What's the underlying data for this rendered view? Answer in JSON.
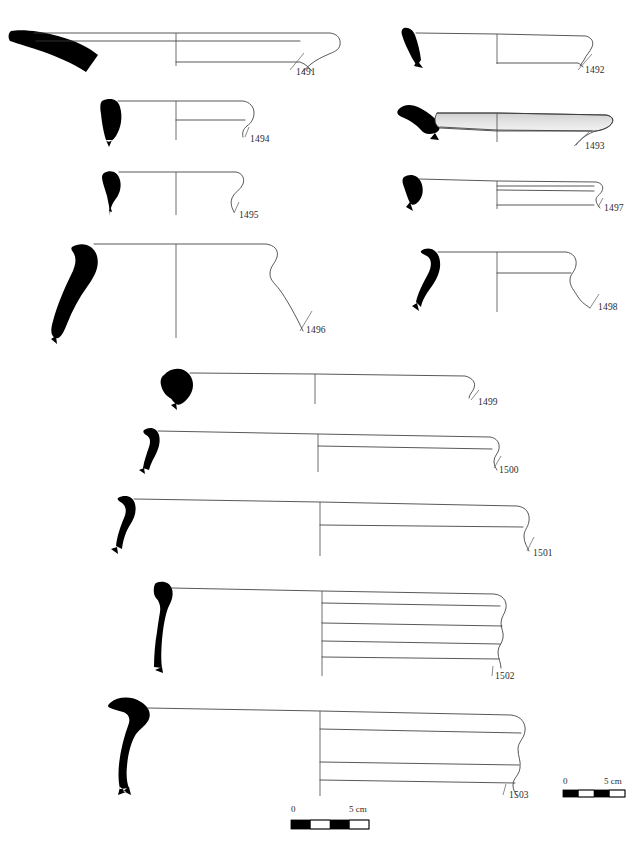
{
  "plate": {
    "title": "Pottery profile plate",
    "description": "Archaeological line drawing plate of ceramic rim and vessel profiles with blackened section fills, radius axis lines, catalogue numbers and two graphic scale bars.",
    "background_color": "#ffffff",
    "ink_color": "#3a3a3a",
    "section_fill_color": "#000000",
    "width": 644,
    "height": 847
  },
  "figures": [
    {
      "id": "1491",
      "label": "1491",
      "label_x": 296,
      "label_y": 75,
      "group": "upper-left",
      "kind": "wide-flaring-rim-bowl",
      "shading": "none",
      "leader_from": [
        289,
        70
      ],
      "leader_to": [
        305,
        52
      ]
    },
    {
      "id": "1492",
      "label": "1492",
      "label_x": 585,
      "label_y": 73,
      "group": "upper-right",
      "kind": "flaring-rim-bowl",
      "shading": "none",
      "leader_from": [
        580,
        68
      ],
      "leader_to": [
        593,
        54
      ]
    },
    {
      "id": "1494",
      "label": "1494",
      "label_x": 250,
      "label_y": 142,
      "group": "upper-left",
      "kind": "thickened-rounded-rim",
      "shading": "none",
      "leader_from": [
        246,
        137
      ],
      "leader_to": [
        254,
        126
      ]
    },
    {
      "id": "1493",
      "label": "1493",
      "label_x": 585,
      "label_y": 149,
      "group": "upper-right",
      "kind": "shallow-shaded-bowl",
      "shading": "grey-wash",
      "leader_from": [
        578,
        144
      ],
      "leader_to": [
        592,
        130
      ]
    },
    {
      "id": "1495",
      "label": "1495",
      "label_x": 239,
      "label_y": 218,
      "group": "upper-left",
      "kind": "everted-rim-jar",
      "shading": "none",
      "leader_from": [
        234,
        213
      ],
      "leader_to": [
        243,
        200
      ]
    },
    {
      "id": "1497",
      "label": "1497",
      "label_x": 604,
      "label_y": 211,
      "group": "upper-right",
      "kind": "grooved-band-rim",
      "shading": "none",
      "leader_from": [
        598,
        206
      ],
      "leader_to": [
        609,
        196
      ]
    },
    {
      "id": "1496",
      "label": "1496",
      "label_x": 306,
      "label_y": 333,
      "group": "upper-left",
      "kind": "large-everted-rim-jar",
      "shading": "none",
      "leader_from": [
        300,
        330
      ],
      "leader_to": [
        312,
        310
      ]
    },
    {
      "id": "1498",
      "label": "1498",
      "label_x": 598,
      "label_y": 310,
      "group": "upper-right",
      "kind": "hooked-rim-jar",
      "shading": "none",
      "leader_from": [
        592,
        306
      ],
      "leader_to": [
        602,
        292
      ]
    },
    {
      "id": "1499",
      "label": "1499",
      "label_x": 478,
      "label_y": 405,
      "group": "lower",
      "kind": "large-open-basin",
      "shading": "none",
      "leader_from": [
        473,
        400
      ],
      "leader_to": [
        481,
        390
      ]
    },
    {
      "id": "1500",
      "label": "1500",
      "label_x": 499,
      "label_y": 473,
      "group": "lower",
      "kind": "large-basin-rounded-rim",
      "shading": "none",
      "leader_from": [
        494,
        468
      ],
      "leader_to": [
        503,
        455
      ]
    },
    {
      "id": "1501",
      "label": "1501",
      "label_x": 533,
      "label_y": 556,
      "group": "lower",
      "kind": "large-basin-flattened-rim",
      "shading": "none",
      "leader_from": [
        527,
        551
      ],
      "leader_to": [
        536,
        535
      ]
    },
    {
      "id": "1502",
      "label": "1502",
      "label_x": 495,
      "label_y": 679,
      "group": "lower",
      "kind": "ribbed-wall-basin",
      "shading": "none",
      "leader_from": [
        491,
        675
      ],
      "leader_to": [
        496,
        668
      ]
    },
    {
      "id": "1503",
      "label": "1503",
      "label_x": 509,
      "label_y": 798,
      "group": "lower",
      "kind": "large-ribbed-basin-heavy-rim",
      "shading": "none",
      "leader_from": [
        504,
        793
      ],
      "leader_to": [
        509,
        782
      ]
    }
  ],
  "scale_bars": [
    {
      "name": "scale-bar-lower",
      "zero_label": "0",
      "max_label": "5 cm",
      "x": 291,
      "y": 812,
      "bar_x": 291,
      "bar_y": 820,
      "bar_width": 78,
      "bar_height": 9,
      "segments": 4
    },
    {
      "name": "scale-bar-right",
      "zero_label": "0",
      "max_label": "5 cm",
      "x": 563,
      "y": 783,
      "bar_x": 563,
      "bar_y": 790,
      "bar_width": 62,
      "bar_height": 7,
      "segments": 4
    }
  ]
}
